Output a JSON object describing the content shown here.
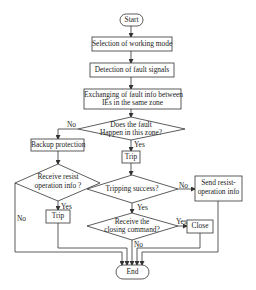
{
  "nodes": {
    "start": {
      "type": "terminal",
      "label": "Start"
    },
    "selection": {
      "type": "process",
      "label": "Selection of working mode"
    },
    "detection": {
      "type": "process",
      "label": "Detection of fault signals"
    },
    "exchanging": {
      "type": "process",
      "label_line1": "Exchanging of fault info between",
      "label_line2": "IEs in the same zone"
    },
    "fault_decision": {
      "type": "decision",
      "label_line1": "Does the fault",
      "label_line2": "Happen in this zone?"
    },
    "backup": {
      "type": "process",
      "label": "Backup protection"
    },
    "trip_main": {
      "type": "process",
      "label": "Trip"
    },
    "resist_decision": {
      "type": "decision",
      "label_line1": "Receive resist",
      "label_line2": "operation info ?"
    },
    "tripping_decision": {
      "type": "decision",
      "label": "Tripping success?"
    },
    "send_resist": {
      "type": "process",
      "label_line1": "Send resist-",
      "label_line2": "operation info"
    },
    "trip_backup": {
      "type": "process",
      "label": "Trip"
    },
    "closing_decision": {
      "type": "decision",
      "label_line1": "Receive the",
      "label_line2": "closing command?"
    },
    "close": {
      "type": "process",
      "label": "Close"
    },
    "end": {
      "type": "terminal",
      "label": "End"
    }
  },
  "edges": {
    "fault_no": "No",
    "fault_yes": "Yes",
    "resist_yes": "Yes",
    "resist_no": "No",
    "tripping_no": "No",
    "tripping_yes": "Yes",
    "closing_yes": "Yes",
    "closing_no": "No"
  },
  "colors": {
    "line": "#333333",
    "background": "#ffffff"
  }
}
